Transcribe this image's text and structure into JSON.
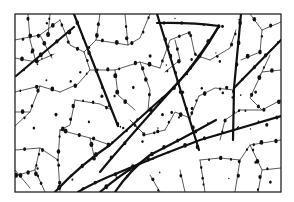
{
  "figure": {
    "frame": {
      "x": 15,
      "y": 14,
      "width": 266,
      "height": 178
    },
    "colors": {
      "ink": "#111111",
      "background": "#ffffff"
    },
    "major_veins": [
      "M74,14 L118,126",
      "M74,27 L16,76",
      "M157,14 L199,150",
      "M157,23 Q190,22 219,26 Q200,60 175,86 Q140,125 110,160 L100,172",
      "M241,14 L234,88 L233,140",
      "M281,40 L234,88",
      "M281,116 Q240,128 200,140 Q160,155 120,172 Q95,182 78,192",
      "M216,120 Q180,140 150,155 Q130,170 115,192",
      "M55,192 Q80,165 110,145 Q140,118 160,100 Q185,80 219,26",
      "M100,192 Q120,175 140,163"
    ],
    "minor_veins": [
      "M15,40 L40,35 L60,20",
      "M28,14 L30,40 L36,62",
      "M40,35 L52,58",
      "M50,14 L48,36",
      "M15,58 L36,62 L54,54",
      "M60,20 L70,45 L84,52",
      "M84,52 L96,40 L100,14",
      "M96,40 L128,45 L140,38 L150,14",
      "M128,45 L125,14",
      "M84,52 L90,70 L78,84 L60,92",
      "M15,92 L40,86 L60,92",
      "M40,86 L30,112 L15,126",
      "M15,112 L30,112",
      "M90,70 L115,70 L140,62 L160,68",
      "M115,70 L118,95 L135,110",
      "M140,62 L150,90 L148,110",
      "M160,68 L170,40 L190,32",
      "M190,32 L195,55 L210,60",
      "M175,40 L180,60 L165,72",
      "M210,60 L230,48 L236,30",
      "M199,96 L215,88 L234,90",
      "M199,96 L190,118",
      "M241,60 L260,52 L262,30 L281,22",
      "M250,14 L262,30",
      "M281,70 L262,72 L250,98 L262,110",
      "M262,72 L270,55",
      "M240,110 L262,110 L281,100",
      "M281,140 L250,145 L240,160 L235,192",
      "M250,145 L262,170 L281,168",
      "M262,170 L258,192",
      "M200,160 L220,158 L240,160",
      "M200,160 L205,192",
      "M180,170 L185,192",
      "M150,175 L160,192",
      "M60,130 L90,138 L110,145",
      "M60,130 L58,160",
      "M15,150 L40,148 L58,160",
      "M40,148 L35,170 L15,176",
      "M58,160 L60,192",
      "M75,100 L70,125 L60,130",
      "M75,100 L100,104 L112,110",
      "M35,170 L45,192",
      "M90,138 L95,160",
      "M130,120 L145,135 L165,130",
      "M165,130 L175,112 L190,118",
      "M220,140 L225,120 L240,110",
      "M15,170 L30,188"
    ],
    "dot_count_estimate": 260
  }
}
